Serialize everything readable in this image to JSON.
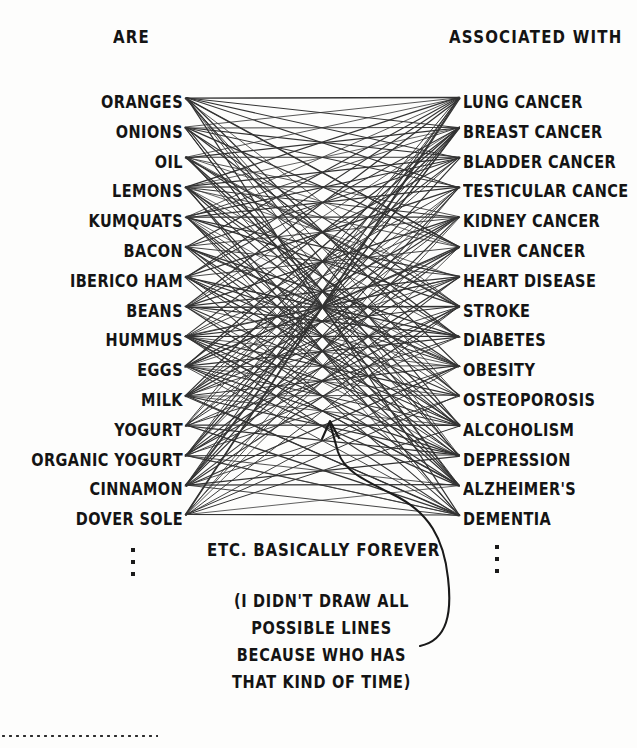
{
  "headers": {
    "left": "ARE",
    "right": "ASSOCIATED WITH"
  },
  "left_column": {
    "name": "foods",
    "items": [
      "ORANGES",
      "ONIONS",
      "OIL",
      "LEMONS",
      "KUMQUATS",
      "BACON",
      "IBERICO HAM",
      "BEANS",
      "HUMMUS",
      "EGGS",
      "MILK",
      "YOGURT",
      "ORGANIC YOGURT",
      "CINNAMON",
      "DOVER SOLE"
    ],
    "continues_marker": "vertical-ellipsis"
  },
  "right_column": {
    "name": "conditions",
    "items": [
      "LUNG CANCER",
      "BREAST CANCER",
      "BLADDER CANCER",
      "TESTICULAR CANCE",
      "KIDNEY CANCER",
      "LIVER CANCER",
      "HEART DISEASE",
      "STROKE",
      "DIABETES",
      "OBESITY",
      "OSTEOPOROSIS",
      "ALCOHOLISM",
      "DEPRESSION",
      "ALZHEIMER'S",
      "DEMENTIA"
    ],
    "continues_marker": "vertical-ellipsis"
  },
  "annotations": {
    "etc": "ETC. BASICALLY FOREVER",
    "paren_lines": [
      "(I DIDN'T DRAW ALL",
      "POSSIBLE LINES",
      "BECAUSE WHO HAS",
      "THAT KIND OF TIME)"
    ],
    "arrow": "curved-arrow-pointing-up-into-network"
  },
  "colors": {
    "ink": "#141414",
    "line": "#222222",
    "background": "#fdfdfc"
  },
  "chart_data": {
    "type": "diagram",
    "subtype": "bipartite-network",
    "title": "",
    "left_nodes": [
      "ORANGES",
      "ONIONS",
      "OIL",
      "LEMONS",
      "KUMQUATS",
      "BACON",
      "IBERICO HAM",
      "BEANS",
      "HUMMUS",
      "EGGS",
      "MILK",
      "YOGURT",
      "ORGANIC YOGURT",
      "CINNAMON",
      "DOVER SOLE"
    ],
    "right_nodes": [
      "LUNG CANCER",
      "BREAST CANCER",
      "BLADDER CANCER",
      "TESTICULAR CANCE",
      "KIDNEY CANCER",
      "LIVER CANCER",
      "HEART DISEASE",
      "STROKE",
      "DIABETES",
      "OBESITY",
      "OSTEOPOROSIS",
      "ALCOHOLISM",
      "DEPRESSION",
      "ALZHEIMER'S",
      "DEMENTIA"
    ],
    "edge_description": "dense many-to-many straight-line connections from every food to many conditions",
    "edge_count_approx": 150,
    "note": "not all possible lines are drawn"
  },
  "layout": {
    "left_label_right_edge_x": 183,
    "right_label_left_edge_x": 463,
    "edge_start_x": 186,
    "edge_end_x": 459,
    "first_row_y": 101,
    "row_spacing": 29.8
  }
}
